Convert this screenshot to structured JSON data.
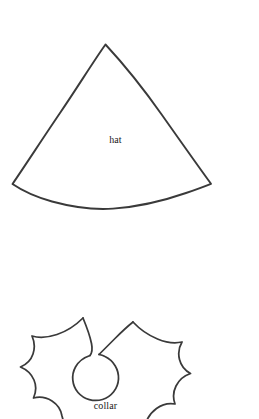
{
  "page": {
    "background_color": "#ffffff",
    "ink_color": "#3a3a3a",
    "width": 259,
    "height": 419
  },
  "figures": [
    {
      "id": "hat",
      "label": "hat",
      "shape": "cone-sector",
      "description": "pointed cone pattern piece with curved bottom edge"
    },
    {
      "id": "collar",
      "label": "collar",
      "shape": "spiked-ring",
      "description": "holly-leaf style spiked collar with round neck hole, cropped at page bottom"
    }
  ],
  "labels": {
    "hat": "hat",
    "collar": "collar"
  }
}
